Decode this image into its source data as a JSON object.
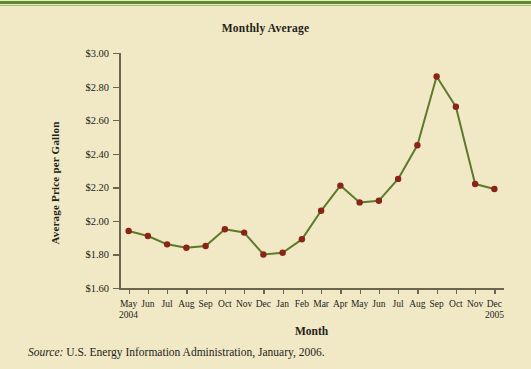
{
  "figure": {
    "title": "Monthly Average",
    "xaxis_title": "Month",
    "yaxis_title": "Average Price per Gallon",
    "source_prefix": "Source:",
    "source_text": "U.S. Energy Information Administration, January, 2006.",
    "background_color": "#f1e8c6",
    "rule_color": "#5d8a2f",
    "line_color": "#5c7a28",
    "marker_color": "#8b2318",
    "axis_color": "#6b6550"
  },
  "chart_data": {
    "type": "line",
    "title": "Monthly Average",
    "xlabel": "Month",
    "ylabel": "Average Price per Gallon",
    "ylim": [
      1.6,
      3.0
    ],
    "ytick_labels": [
      "$3.00",
      "$2.80",
      "$2.60",
      "$2.40",
      "$2.20",
      "$2.00",
      "$1.80",
      "$1.60"
    ],
    "ytick_values": [
      3.0,
      2.8,
      2.6,
      2.4,
      2.2,
      2.0,
      1.8,
      1.6
    ],
    "grid": false,
    "legend": false,
    "categories": [
      "May",
      "Jun",
      "Jul",
      "Aug",
      "Sep",
      "Oct",
      "Nov",
      "Dec",
      "Jan",
      "Feb",
      "Mar",
      "Apr",
      "May",
      "Jun",
      "Jul",
      "Aug",
      "Sep",
      "Oct",
      "Nov",
      "Dec"
    ],
    "year_markers": [
      {
        "index": 0,
        "label": "2004"
      },
      {
        "index": 19,
        "label": "2005"
      }
    ],
    "values": [
      1.94,
      1.91,
      1.86,
      1.84,
      1.85,
      1.95,
      1.93,
      1.8,
      1.81,
      1.89,
      2.06,
      2.21,
      2.11,
      2.12,
      2.25,
      2.45,
      2.86,
      2.68,
      2.22,
      2.19
    ],
    "series": [
      {
        "name": "Average Price per Gallon",
        "values": [
          1.94,
          1.91,
          1.86,
          1.84,
          1.85,
          1.95,
          1.93,
          1.8,
          1.81,
          1.89,
          2.06,
          2.21,
          2.11,
          2.12,
          2.25,
          2.45,
          2.86,
          2.68,
          2.22,
          2.19
        ]
      }
    ]
  }
}
